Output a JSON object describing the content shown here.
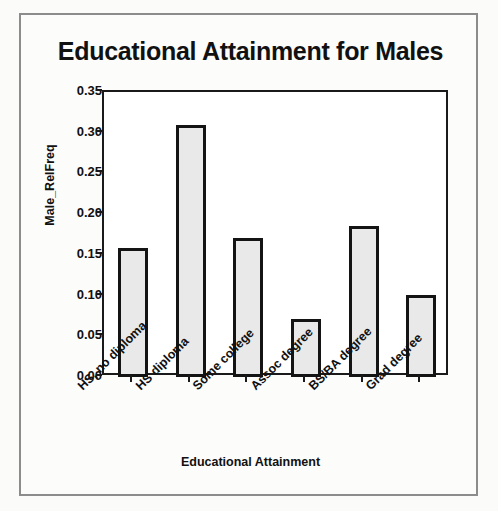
{
  "chart_data": {
    "type": "bar",
    "title": "Educational Attainment for Males",
    "xlabel": "Educational Attainment",
    "ylabel": "Male_RelFreq",
    "categories": [
      "HS, no diploma",
      "HS diploma",
      "Some college",
      "Assoc degree",
      "BS/BA degree",
      "Grad degree"
    ],
    "values": [
      0.159,
      0.309,
      0.171,
      0.071,
      0.185,
      0.101
    ],
    "ylim": [
      0.0,
      0.35
    ],
    "ytick_labels": [
      "0.00",
      "0.05",
      "0.10",
      "0.15",
      "0.20",
      "0.25",
      "0.30",
      "0.35"
    ],
    "ytick_values": [
      0.0,
      0.05,
      0.1,
      0.15,
      0.2,
      0.25,
      0.3,
      0.35
    ],
    "grid": false,
    "legend": "none",
    "bar_fill_color": "#e9e9e9",
    "bar_edge_color": "#141414",
    "plot_background": "#ffffff",
    "figure_background": "#fcfcfb",
    "text_color": "#111111"
  }
}
